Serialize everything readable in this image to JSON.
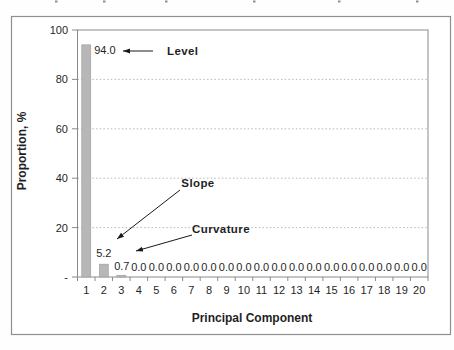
{
  "chart_data": {
    "type": "bar",
    "title": "",
    "xlabel": "Principal Component",
    "ylabel": "Proportion, %",
    "categories": [
      "1",
      "2",
      "3",
      "4",
      "5",
      "6",
      "7",
      "8",
      "9",
      "10",
      "11",
      "12",
      "13",
      "14",
      "15",
      "16",
      "17",
      "18",
      "19",
      "20"
    ],
    "values": [
      94.0,
      5.2,
      0.7,
      0.0,
      0.0,
      0.0,
      0.0,
      0.0,
      0.0,
      0.0,
      0.0,
      0.0,
      0.0,
      0.0,
      0.0,
      0.0,
      0.0,
      0.0,
      0.0,
      0.0
    ],
    "value_labels": [
      "94.0",
      "5.2",
      "0.7",
      "0.0",
      "0.0",
      "0.0",
      "0.0",
      "0.0",
      "0.0",
      "0.0",
      "0.0",
      "0.0",
      "0.0",
      "0.0",
      "0.0",
      "0.0",
      "0.0",
      "0.0",
      "0.0",
      "0.0"
    ],
    "ylim": [
      0,
      100
    ],
    "ytick_values": [
      100,
      80,
      60,
      40,
      20,
      0
    ],
    "ytick_labels": [
      "100",
      "80",
      "60",
      "40",
      "20",
      "-"
    ],
    "grid_values": [
      20,
      40,
      60,
      80
    ],
    "grid_style": "dotted",
    "legend": "none",
    "colors": {
      "bar_fill": "#b7b7b7",
      "bar_border": "#9b9b9b",
      "gridline": "#b9b9b9",
      "axis_border": "#8a8a8a",
      "outer_border": "#8f8f8f",
      "text": "#1f1f1f"
    },
    "annotations": [
      {
        "label": "Level",
        "points_to": "bar 1 (94.0)",
        "anchor": "start",
        "text_x": 167,
        "text_y": 55,
        "arrow": {
          "x1": 153,
          "y1": 51,
          "x2": 123,
          "y2": 51
        }
      },
      {
        "label": "Slope",
        "points_to": "bar 2 (5.2)",
        "anchor": "middle",
        "text_x": 198,
        "text_y": 187,
        "arrow": {
          "x1": 180,
          "y1": 190,
          "x2": 117,
          "y2": 239
        }
      },
      {
        "label": "Curvature",
        "points_to": "bar 3 (0.7)",
        "anchor": "middle",
        "text_x": 221,
        "text_y": 233,
        "arrow": {
          "x1": 192,
          "y1": 235,
          "x2": 136,
          "y2": 251
        }
      }
    ]
  },
  "decor": {
    "top_clipped_marks_x": [
      55,
      103,
      165,
      253,
      338,
      416
    ]
  }
}
